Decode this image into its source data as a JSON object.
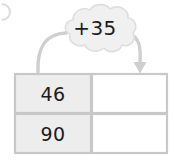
{
  "worksheet": {
    "operation_label": "+35",
    "edge_mark": "",
    "table": {
      "rows": [
        {
          "input": "46",
          "output": ""
        },
        {
          "input": "90",
          "output": ""
        }
      ]
    },
    "arrows": [
      {
        "name": "left-curve",
        "has_arrowhead": false,
        "direction": "down-left"
      },
      {
        "name": "right-curve",
        "has_arrowhead": true,
        "direction": "down-right"
      }
    ],
    "colors": {
      "cloud_fill": "#f0f0f0",
      "cloud_stroke": "#d8d8d8",
      "arrow_stroke": "#c9c9c9",
      "table_border": "#c8c8c8",
      "input_cell_fill": "#ededed",
      "output_cell_fill": "#ffffff",
      "text": "#1b1b1b"
    }
  }
}
